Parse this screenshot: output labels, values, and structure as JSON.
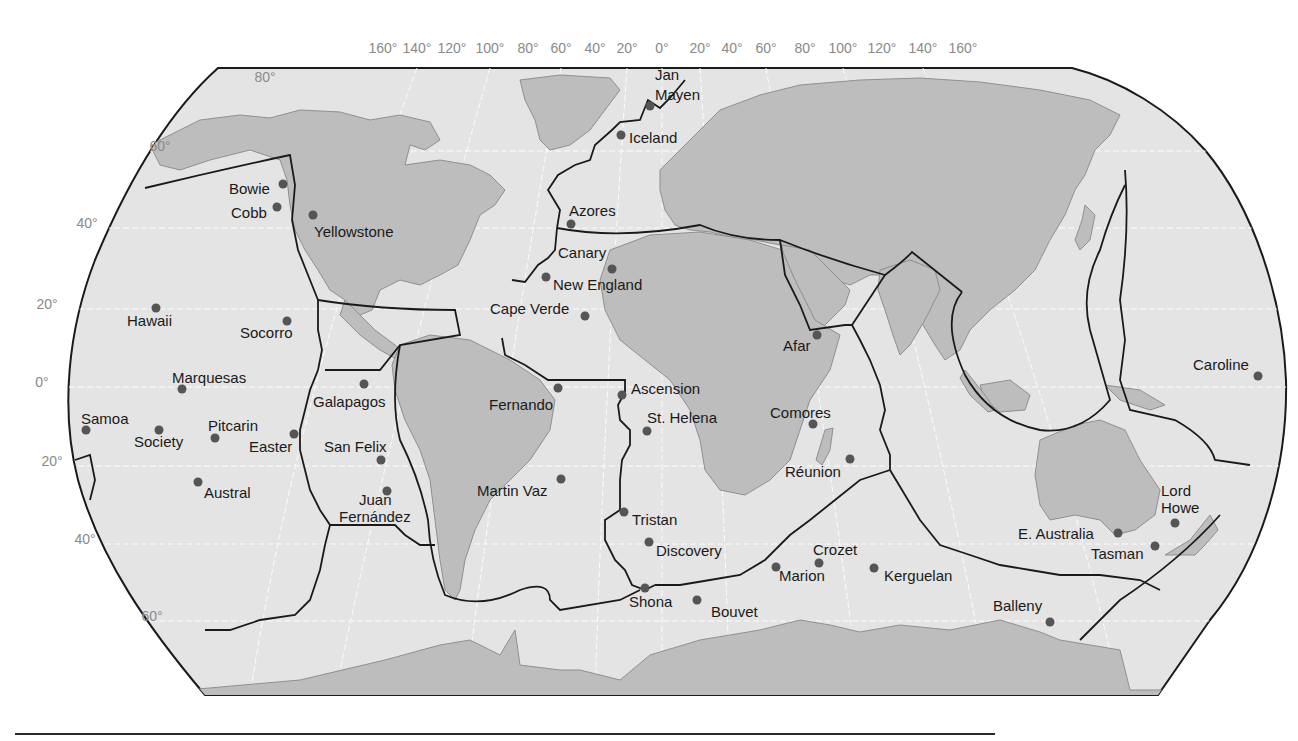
{
  "map": {
    "title": "",
    "colors": {
      "ocean": "#e4e4e4",
      "land": "#bdbdbd",
      "boundary": "#1a1a1a",
      "hotspot": "#555555",
      "graticule_label": "#8a8a8a"
    },
    "longitude_labels": [
      {
        "text": "160°",
        "x": 383
      },
      {
        "text": "140°",
        "x": 417
      },
      {
        "text": "120°",
        "x": 452
      },
      {
        "text": "100°",
        "x": 490
      },
      {
        "text": "80°",
        "x": 528
      },
      {
        "text": "60°",
        "x": 561
      },
      {
        "text": "40°",
        "x": 595
      },
      {
        "text": "20°",
        "x": 627
      },
      {
        "text": "0°",
        "x": 662
      },
      {
        "text": "20°",
        "x": 700
      },
      {
        "text": "40°",
        "x": 732
      },
      {
        "text": "60°",
        "x": 766
      },
      {
        "text": "80°",
        "x": 805
      },
      {
        "text": "100°",
        "x": 843
      },
      {
        "text": "120°",
        "x": 882
      },
      {
        "text": "140°",
        "x": 923
      },
      {
        "text": "160°",
        "x": 963
      }
    ],
    "latitude_labels": [
      {
        "text": "80°",
        "x": 265,
        "y": 82
      },
      {
        "text": "60°",
        "x": 160,
        "y": 151
      },
      {
        "text": "40°",
        "x": 87,
        "y": 228
      },
      {
        "text": "20°",
        "x": 47,
        "y": 309
      },
      {
        "text": "0°",
        "x": 42,
        "y": 387
      },
      {
        "text": "20°",
        "x": 52,
        "y": 466
      },
      {
        "text": "40°",
        "x": 85,
        "y": 544
      },
      {
        "text": "60°",
        "x": 152,
        "y": 621
      }
    ],
    "hotspots": [
      {
        "name": "Jan Mayen",
        "lines": [
          "Jan",
          "Mayen"
        ],
        "dot": [
          650,
          106
        ],
        "label": [
          655,
          80
        ],
        "label2": [
          655,
          100
        ]
      },
      {
        "name": "Iceland",
        "lines": [
          "Iceland"
        ],
        "dot": [
          621,
          135
        ],
        "label": [
          629,
          143
        ]
      },
      {
        "name": "Bowie",
        "lines": [
          "Bowie"
        ],
        "dot": [
          283,
          184
        ],
        "label": [
          229,
          194
        ]
      },
      {
        "name": "Cobb",
        "lines": [
          "Cobb"
        ],
        "dot": [
          277,
          207
        ],
        "label": [
          231,
          218
        ]
      },
      {
        "name": "Yellowstone",
        "lines": [
          "Yellowstone"
        ],
        "dot": [
          313,
          215
        ],
        "label": [
          314,
          237
        ]
      },
      {
        "name": "Azores",
        "lines": [
          "Azores"
        ],
        "dot": [
          571,
          224
        ],
        "label": [
          569,
          216
        ]
      },
      {
        "name": "Canary",
        "lines": [
          "Canary"
        ],
        "dot": [
          612,
          269
        ],
        "label": [
          558,
          258
        ]
      },
      {
        "name": "New England",
        "lines": [
          "New England"
        ],
        "dot": [
          546,
          277
        ],
        "label": [
          553,
          290
        ]
      },
      {
        "name": "Cape Verde",
        "lines": [
          "Cape Verde"
        ],
        "dot": [
          585,
          316
        ],
        "label": [
          490,
          314
        ]
      },
      {
        "name": "Hawaii",
        "lines": [
          "Hawaii"
        ],
        "dot": [
          156,
          308
        ],
        "label": [
          127,
          326
        ]
      },
      {
        "name": "Socorro",
        "lines": [
          "Socorro"
        ],
        "dot": [
          287,
          321
        ],
        "label": [
          240,
          338
        ]
      },
      {
        "name": "Afar",
        "lines": [
          "Afar"
        ],
        "dot": [
          817,
          335
        ],
        "label": [
          783,
          351
        ]
      },
      {
        "name": "Caroline",
        "lines": [
          "Caroline"
        ],
        "dot": [
          1258,
          376
        ],
        "label": [
          1193,
          370
        ]
      },
      {
        "name": "Marquesas",
        "lines": [
          "Marquesas"
        ],
        "dot": [
          182,
          389
        ],
        "label": [
          172,
          383
        ]
      },
      {
        "name": "Galapagos",
        "lines": [
          "Galapagos"
        ],
        "dot": [
          364,
          384
        ],
        "label": [
          313,
          407
        ]
      },
      {
        "name": "Fernando",
        "lines": [
          "Fernando"
        ],
        "dot": [
          558,
          388
        ],
        "label": [
          489,
          410
        ]
      },
      {
        "name": "Ascension",
        "lines": [
          "Ascension"
        ],
        "dot": [
          622,
          395
        ],
        "label": [
          631,
          394
        ]
      },
      {
        "name": "St. Helena",
        "lines": [
          "St. Helena"
        ],
        "dot": [
          647,
          431
        ],
        "label": [
          647,
          423
        ]
      },
      {
        "name": "Comores",
        "lines": [
          "Comores"
        ],
        "dot": [
          813,
          424
        ],
        "label": [
          770,
          418
        ]
      },
      {
        "name": "Samoa",
        "lines": [
          "Samoa"
        ],
        "dot": [
          86,
          430
        ],
        "label": [
          81,
          424
        ]
      },
      {
        "name": "Society",
        "lines": [
          "Society"
        ],
        "dot": [
          159,
          430
        ],
        "label": [
          134,
          447
        ]
      },
      {
        "name": "Pitcarin",
        "lines": [
          "Pitcarin"
        ],
        "dot": [
          215,
          438
        ],
        "label": [
          208,
          431
        ]
      },
      {
        "name": "Easter",
        "lines": [
          "Easter"
        ],
        "dot": [
          294,
          434
        ],
        "label": [
          249,
          452
        ]
      },
      {
        "name": "San Felix",
        "lines": [
          "San Felix"
        ],
        "dot": [
          381,
          460
        ],
        "label": [
          324,
          452
        ]
      },
      {
        "name": "Réunion",
        "lines": [
          "Réunion"
        ],
        "dot": [
          850,
          459
        ],
        "label": [
          785,
          477
        ]
      },
      {
        "name": "Martin Vaz",
        "lines": [
          "Martin Vaz"
        ],
        "dot": [
          561,
          479
        ],
        "label": [
          477,
          496
        ]
      },
      {
        "name": "Austral",
        "lines": [
          "Austral"
        ],
        "dot": [
          198,
          482
        ],
        "label": [
          204,
          498
        ]
      },
      {
        "name": "Juan Fernández",
        "lines": [
          "Juan",
          "Fernández"
        ],
        "dot": [
          387,
          491
        ],
        "label": [
          359,
          505
        ],
        "label2": [
          339,
          522
        ]
      },
      {
        "name": "Lord Howe",
        "lines": [
          "Lord",
          "Howe"
        ],
        "dot": [
          1175,
          523
        ],
        "label": [
          1161,
          496
        ],
        "label2": [
          1161,
          513
        ]
      },
      {
        "name": "Tristan",
        "lines": [
          "Tristan"
        ],
        "dot": [
          624,
          512
        ],
        "label": [
          632,
          525
        ]
      },
      {
        "name": "E. Australia",
        "lines": [
          "E. Australia"
        ],
        "dot": [
          1118,
          533
        ],
        "label": [
          1018,
          539
        ]
      },
      {
        "name": "Discovery",
        "lines": [
          "Discovery"
        ],
        "dot": [
          649,
          542
        ],
        "label": [
          656,
          556
        ]
      },
      {
        "name": "Tasman",
        "lines": [
          "Tasman"
        ],
        "dot": [
          1155,
          546
        ],
        "label": [
          1091,
          559
        ]
      },
      {
        "name": "Crozet",
        "lines": [
          "Crozet"
        ],
        "dot": [
          819,
          563
        ],
        "label": [
          813,
          555
        ]
      },
      {
        "name": "Marion",
        "lines": [
          "Marion"
        ],
        "dot": [
          776,
          567
        ],
        "label": [
          779,
          581
        ]
      },
      {
        "name": "Kerguelan",
        "lines": [
          "Kerguelan"
        ],
        "dot": [
          874,
          568
        ],
        "label": [
          884,
          581
        ]
      },
      {
        "name": "Shona",
        "lines": [
          "Shona"
        ],
        "dot": [
          645,
          588
        ],
        "label": [
          629,
          607
        ]
      },
      {
        "name": "Bouvet",
        "lines": [
          "Bouvet"
        ],
        "dot": [
          697,
          600
        ],
        "label": [
          711,
          617
        ]
      },
      {
        "name": "Balleny",
        "lines": [
          "Balleny"
        ],
        "dot": [
          1050,
          622
        ],
        "label": [
          993,
          611
        ]
      }
    ]
  }
}
